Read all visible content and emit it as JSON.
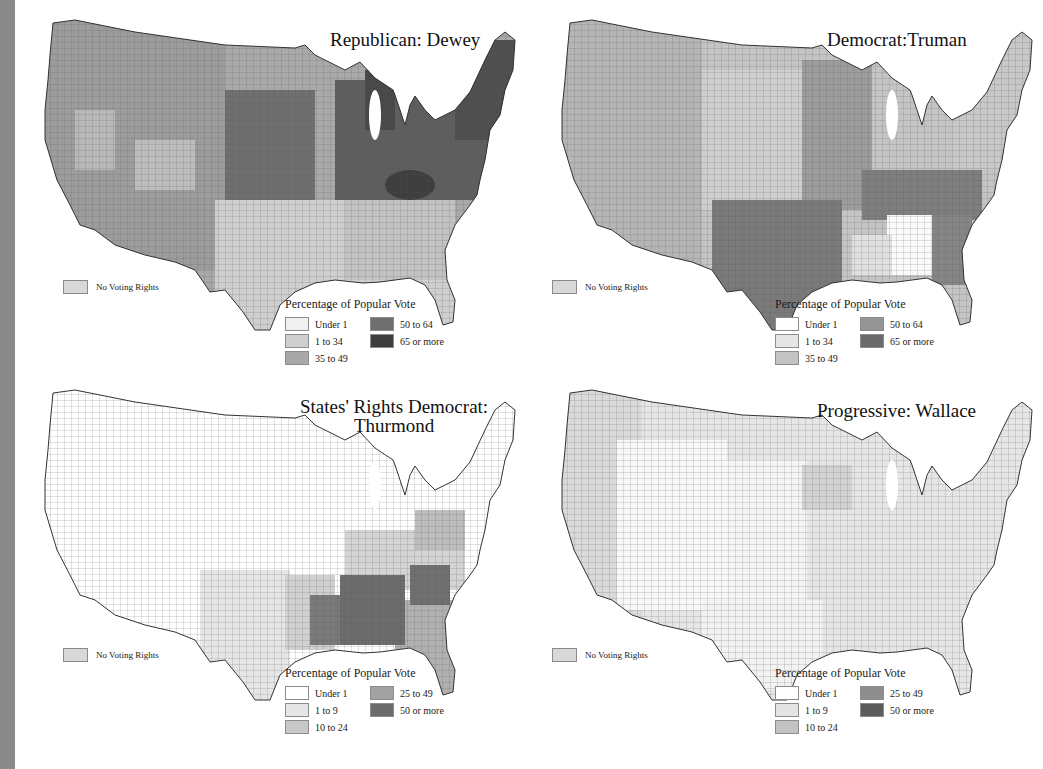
{
  "maps": [
    {
      "title": "Republican: Dewey",
      "no_voting_rights_label": "No Voting Rights",
      "legend_title": "Percentage of Popular Vote",
      "legend": [
        {
          "label": "Under 1",
          "color": "#f0f0f0"
        },
        {
          "label": "1 to 34",
          "color": "#cfcfcf"
        },
        {
          "label": "35 to 49",
          "color": "#a8a8a8"
        },
        {
          "label": "50 to 64",
          "color": "#6f6f6f"
        },
        {
          "label": "65 or more",
          "color": "#3e3e3e"
        }
      ]
    },
    {
      "title": "Democrat:Truman",
      "no_voting_rights_label": "No Voting Rights",
      "legend_title": "Percentage of Popular Vote",
      "legend": [
        {
          "label": "Under 1",
          "color": "#ffffff"
        },
        {
          "label": "1 to 34",
          "color": "#e6e6e6"
        },
        {
          "label": "35 to 49",
          "color": "#c4c4c4"
        },
        {
          "label": "50 to 64",
          "color": "#959595"
        },
        {
          "label": "65 or more",
          "color": "#6a6a6a"
        }
      ]
    },
    {
      "title": "States' Rights Democrat:",
      "title_line2": "Thurmond",
      "no_voting_rights_label": "No Voting Rights",
      "legend_title": "Percentage of Popular Vote",
      "legend": [
        {
          "label": "Under 1",
          "color": "#ffffff"
        },
        {
          "label": "1 to 9",
          "color": "#e6e6e6"
        },
        {
          "label": "10 to 24",
          "color": "#c8c8c8"
        },
        {
          "label": "25 to 49",
          "color": "#a2a2a2"
        },
        {
          "label": "50 or more",
          "color": "#6c6c6c"
        }
      ]
    },
    {
      "title": "Progressive: Wallace",
      "no_voting_rights_label": "No Voting Rights",
      "legend_title": "Percentage of Popular Vote",
      "legend": [
        {
          "label": "Under 1",
          "color": "#ffffff"
        },
        {
          "label": "1 to 9",
          "color": "#e4e4e4"
        },
        {
          "label": "10 to 24",
          "color": "#c2c2c2"
        },
        {
          "label": "25 to 49",
          "color": "#8e8e8e"
        },
        {
          "label": "50 or more",
          "color": "#5c5c5c"
        }
      ]
    }
  ],
  "colors": {
    "left_strip": "#8a8a8a",
    "background": "#ffffff",
    "border": "#3a3a3a"
  }
}
